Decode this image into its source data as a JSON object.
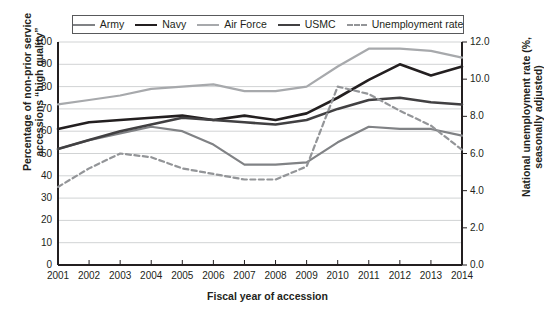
{
  "legend": {
    "items": [
      {
        "label": "Army",
        "color": "#808285",
        "style": "solid",
        "width": 2.2
      },
      {
        "label": "Navy",
        "color": "#231f20",
        "style": "solid",
        "width": 2.6
      },
      {
        "label": "Air Force",
        "color": "#a7a9ac",
        "style": "solid",
        "width": 2.2
      },
      {
        "label": "USMC",
        "color": "#414042",
        "style": "solid",
        "width": 2.6
      },
      {
        "label": "Unemployment rate",
        "color": "#939598",
        "style": "dashed",
        "width": 2.0
      }
    ]
  },
  "axes": {
    "x_title": "Fiscal year of accession",
    "y_left_title": "Percentage of non-prior service accessions “high quality”",
    "y_right_title": "National unemployment rate (%, seasonally adjusted)",
    "x_ticks": [
      "2001",
      "2002",
      "2003",
      "2004",
      "2005",
      "2006",
      "2007",
      "2008",
      "2009",
      "2010",
      "2011",
      "2012",
      "2013",
      "2014"
    ],
    "y_left_ticks": [
      "100",
      "90",
      "80",
      "70",
      "60",
      "50",
      "40",
      "30",
      "20",
      "10",
      "0"
    ],
    "y_right_ticks": [
      "12.0",
      "10.0",
      "8.0",
      "6.0",
      "4.0",
      "2.0",
      "0.0"
    ]
  },
  "chart_data": {
    "type": "line",
    "title": "",
    "xlabel": "Fiscal year of accession",
    "ylabel": "Percentage of non-prior service accessions “high quality”",
    "y2label": "National unemployment rate (%, seasonally adjusted)",
    "x": [
      2001,
      2002,
      2003,
      2004,
      2005,
      2006,
      2007,
      2008,
      2009,
      2010,
      2011,
      2012,
      2013,
      2014
    ],
    "ylim": [
      0,
      100
    ],
    "y2lim": [
      0,
      12
    ],
    "grid": true,
    "legend_position": "top",
    "series": [
      {
        "name": "Army",
        "axis": "left",
        "color": "#808285",
        "style": "solid",
        "values": [
          52,
          56,
          59,
          62,
          60,
          54,
          45,
          45,
          46,
          55,
          62,
          61,
          61,
          58
        ]
      },
      {
        "name": "Navy",
        "axis": "left",
        "color": "#231f20",
        "style": "solid",
        "values": [
          61,
          64,
          65,
          66,
          67,
          65,
          67,
          65,
          68,
          75,
          83,
          90,
          85,
          89
        ]
      },
      {
        "name": "Air Force",
        "axis": "left",
        "color": "#a7a9ac",
        "style": "solid",
        "values": [
          72,
          74,
          76,
          79,
          80,
          81,
          78,
          78,
          80,
          89,
          97,
          97,
          96,
          93
        ]
      },
      {
        "name": "USMC",
        "axis": "left",
        "color": "#414042",
        "style": "solid",
        "values": [
          52,
          56,
          60,
          63,
          66,
          65,
          64,
          63,
          65,
          70,
          74,
          75,
          73,
          72
        ]
      },
      {
        "name": "Unemployment rate",
        "axis": "right",
        "color": "#939598",
        "style": "dashed",
        "values": [
          4.2,
          5.2,
          6.0,
          5.8,
          5.2,
          4.9,
          4.6,
          4.6,
          5.3,
          9.6,
          9.2,
          8.3,
          7.5,
          6.2
        ]
      }
    ]
  }
}
